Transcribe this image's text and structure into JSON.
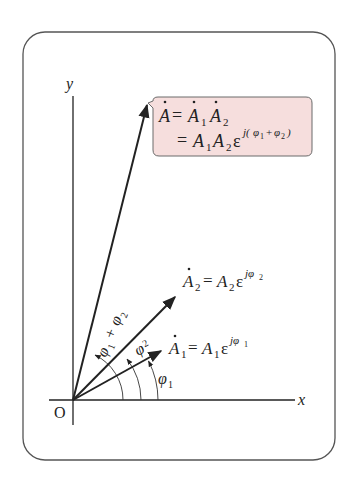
{
  "diagram": {
    "colors": {
      "frame": "#555555",
      "ink": "#222222",
      "callout_fill": "#f6dedd",
      "callout_border": "#6a6a6a"
    },
    "axes": {
      "x_label": "x",
      "y_label": "y",
      "origin_label": "O"
    },
    "vectors": [
      {
        "id": "A1",
        "name": "A",
        "sub": "1",
        "eq": "=",
        "mag": "A",
        "mag_sub": "1",
        "base": "ε",
        "exp": "jφ",
        "exp_sub": "1"
      },
      {
        "id": "A2",
        "name": "A",
        "sub": "2",
        "eq": "=",
        "mag": "A",
        "mag_sub": "2",
        "base": "ε",
        "exp": "jφ",
        "exp_sub": "2"
      },
      {
        "id": "A",
        "name": "A"
      }
    ],
    "callout": {
      "line1_lhs": "A",
      "line1_eq": "=",
      "line1_r1": "A",
      "line1_r1_sub": "1",
      "line1_r2": "A",
      "line1_r2_sub": "2",
      "line2_eq": "=",
      "line2_m1": "A",
      "line2_m1_sub": "1",
      "line2_m2": "A",
      "line2_m2_sub": "2",
      "line2_base": "ε",
      "line2_exp_pre": "j(",
      "line2_exp_phi1": "φ",
      "line2_exp_phi1_sub": "1",
      "line2_exp_plus": "+",
      "line2_exp_phi2": "φ",
      "line2_exp_phi2_sub": "2",
      "line2_exp_post": ")"
    },
    "angles": {
      "phi1": {
        "sym": "φ",
        "sub": "1"
      },
      "phi2": {
        "sym": "φ",
        "sub": "2"
      },
      "phi_sum": {
        "sym1": "φ",
        "sub1": "1",
        "plus": "+",
        "sym2": "φ",
        "sub2": "2"
      }
    }
  }
}
